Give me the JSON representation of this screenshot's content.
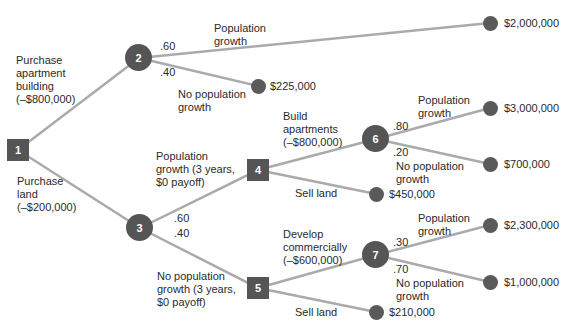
{
  "colors": {
    "edge": "#aaaaaa",
    "node": "#555555",
    "terminal": "#5a5a5a",
    "text": "#2a2a2a"
  },
  "nodes": {
    "n1": "1",
    "n2": "2",
    "n3": "3",
    "n4": "4",
    "n5": "5",
    "n6": "6",
    "n7": "7"
  },
  "labels": {
    "purchase_apartment": [
      "Purchase",
      "apartment",
      "building",
      "(–$800,000)"
    ],
    "purchase_land": [
      "Purchase",
      "land",
      "(–$200,000)"
    ],
    "n2_pop_growth": [
      "Population",
      "growth"
    ],
    "n2_no_pop_growth": [
      "No population",
      "growth"
    ],
    "n2_p_hi": ".60",
    "n2_p_lo": ".40",
    "n3_pop_growth": [
      "Population",
      "growth (3 years,",
      "$0 payoff)"
    ],
    "n3_no_pop_growth": [
      "No population",
      "growth (3 years,",
      "$0 payoff)"
    ],
    "n3_p_hi": ".60",
    "n3_p_lo": ".40",
    "build_apartments": [
      "Build",
      "apartments",
      "(–$800,000)"
    ],
    "sell_land_4": "Sell land",
    "develop_commercially": [
      "Develop",
      "commercially",
      "(–$600,000)"
    ],
    "sell_land_5": "Sell land",
    "n6_pop_growth": [
      "Population",
      "growth"
    ],
    "n6_no_pop_growth": [
      "No population",
      "growth"
    ],
    "n6_p_hi": ".80",
    "n6_p_lo": ".20",
    "n7_pop_growth": [
      "Population",
      "growth"
    ],
    "n7_no_pop_growth": [
      "No population",
      "growth"
    ],
    "n7_p_hi": ".30",
    "n7_p_lo": ".70"
  },
  "payoffs": {
    "p_2000000": "$2,000,000",
    "p_225000": "$225,000",
    "p_3000000": "$3,000,000",
    "p_700000": "$700,000",
    "p_450000": "$450,000",
    "p_2300000": "$2,300,000",
    "p_1000000": "$1,000,000",
    "p_210000": "$210,000"
  }
}
